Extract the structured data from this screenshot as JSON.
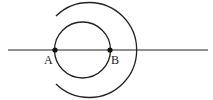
{
  "diagram": {
    "type": "geometric-construction",
    "line": {
      "x1": 8,
      "y1": 50,
      "x2": 208,
      "y2": 50
    },
    "points": [
      {
        "id": "A",
        "label": "A",
        "x": 55,
        "y": 50,
        "label_x": 44,
        "label_y": 64
      },
      {
        "id": "B",
        "label": "B",
        "x": 110,
        "y": 50,
        "label_x": 111,
        "label_y": 64
      }
    ],
    "inner_circle": {
      "cx": 82.5,
      "cy": 50,
      "r": 28
    },
    "outer_arc": {
      "cx": 89,
      "cy": 50,
      "r": 47.5,
      "start_x": 56,
      "start_y": 16,
      "end_x": 56,
      "end_y": 84
    },
    "stroke_color": "#222222"
  }
}
